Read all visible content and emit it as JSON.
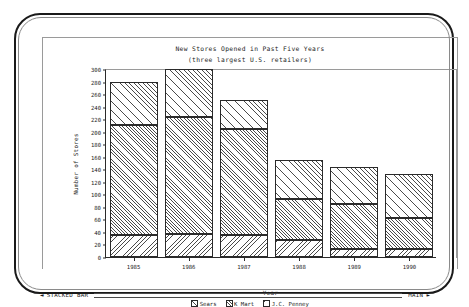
{
  "window": {
    "status_left_arrow": "◄",
    "status_left_label": "STACKED BAR",
    "status_right_label": "MAIN",
    "status_right_arrow": "►"
  },
  "chart_data": {
    "type": "bar",
    "stacked": true,
    "title": "New Stores Opened in Past Five Years",
    "subtitle": "(three largest U.S. retailers)",
    "xlabel": "Year",
    "ylabel": "Number of Stores",
    "categories": [
      "1985",
      "1986",
      "1987",
      "1988",
      "1989",
      "1990"
    ],
    "ylim": [
      0,
      300
    ],
    "yticks": [
      0,
      20,
      40,
      60,
      80,
      100,
      120,
      140,
      160,
      180,
      200,
      220,
      240,
      260,
      280,
      300
    ],
    "grid": false,
    "legend_position": "bottom",
    "series": [
      {
        "name": "J.C. Penney",
        "fill": "fill-jcp",
        "values": [
          35,
          37,
          35,
          27,
          12,
          13
        ]
      },
      {
        "name": "K Mart",
        "fill": "fill-kmart",
        "values": [
          175,
          186,
          169,
          66,
          73,
          49
        ]
      },
      {
        "name": "Sears",
        "fill": "fill-sears",
        "values": [
          70,
          77,
          47,
          62,
          59,
          71
        ]
      }
    ],
    "totals": [
      280,
      300,
      251,
      155,
      144,
      133
    ],
    "legend_order": [
      "Sears",
      "K Mart",
      "J.C. Penney"
    ]
  }
}
